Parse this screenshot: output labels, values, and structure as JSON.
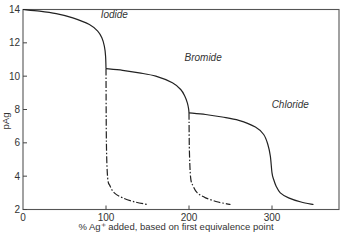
{
  "chart_data": {
    "type": "line",
    "title": "",
    "xlabel": "% Ag⁺ added, based on first equivalence point",
    "ylabel": "pAg",
    "xlim": [
      0,
      380
    ],
    "ylim": [
      2,
      14
    ],
    "grid": false,
    "xticks": [
      0,
      100,
      200,
      300
    ],
    "xtick_labels": [
      "0",
      "100",
      "200",
      "300"
    ],
    "yticks": [
      2,
      4,
      6,
      8,
      10,
      12,
      14
    ],
    "ytick_labels": [
      "2",
      "4",
      "6",
      "8",
      "10",
      "12",
      "14"
    ],
    "series": [
      {
        "name": "Iodide",
        "style": "solid",
        "x": [
          0,
          20,
          40,
          60,
          80,
          90,
          95,
          98,
          99.5,
          100
        ],
        "y": [
          14.0,
          13.9,
          13.75,
          13.5,
          13.1,
          12.7,
          12.3,
          11.8,
          11.2,
          10.45
        ]
      },
      {
        "name": "Iodide (excess, alone)",
        "style": "dash-dot",
        "x": [
          100,
          100.5,
          102,
          105,
          110,
          120,
          135,
          150
        ],
        "y": [
          10.45,
          6.0,
          3.9,
          3.4,
          3.0,
          2.7,
          2.45,
          2.3
        ]
      },
      {
        "name": "Bromide",
        "style": "solid",
        "x": [
          100,
          120,
          140,
          160,
          180,
          190,
          195,
          198,
          199.5,
          200
        ],
        "y": [
          10.45,
          10.35,
          10.2,
          10.0,
          9.6,
          9.2,
          8.8,
          8.4,
          8.05,
          7.8
        ]
      },
      {
        "name": "Bromide (excess, alone)",
        "style": "dash-dot",
        "x": [
          200,
          200.5,
          202,
          205,
          210,
          220,
          235,
          250
        ],
        "y": [
          7.8,
          5.5,
          3.9,
          3.4,
          3.0,
          2.7,
          2.45,
          2.3
        ]
      },
      {
        "name": "Chloride",
        "style": "solid",
        "x": [
          200,
          220,
          240,
          260,
          280,
          290,
          295,
          298,
          300,
          302,
          305,
          310,
          320,
          335,
          350
        ],
        "y": [
          7.8,
          7.7,
          7.55,
          7.35,
          6.95,
          6.5,
          5.9,
          5.2,
          4.2,
          3.8,
          3.4,
          3.0,
          2.7,
          2.45,
          2.3
        ]
      }
    ],
    "annotations": [
      {
        "text": "Iodide",
        "x": 110,
        "y": 13.5
      },
      {
        "text": "Bromide",
        "x": 217,
        "y": 10.9
      },
      {
        "text": "Chloride",
        "x": 322,
        "y": 8.1
      }
    ]
  },
  "plot_box": {
    "left": 23,
    "right": 339,
    "top": 9.5,
    "bottom": 209.5
  }
}
